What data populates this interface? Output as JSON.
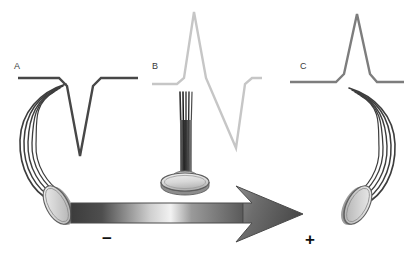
{
  "figure": {
    "background_color": "#ffffff",
    "width": 412,
    "height": 254
  },
  "panels": [
    {
      "id": "A",
      "label": "A",
      "label_x": 14,
      "label_y": 69,
      "trace_color": "#474747",
      "waveform_type": "negative-monophasic",
      "waveform_description": "flat baseline, sharp downward deflection, return to baseline",
      "points": "18,78 59,78 67,86 80,156 93,86 101,78 138,78",
      "electrode": {
        "name": "disc-electrode-left",
        "orientation": "tilted-facing-right",
        "cx": 57,
        "cy": 205,
        "rx": 11,
        "ry": 21,
        "rotation": -28,
        "face_color": "#cfcfcf",
        "rim_color": "#6a6a6a"
      },
      "cable": {
        "name": "cable-bundle-left",
        "strand_count": 5,
        "color": "#3d3d3d",
        "curve": "arcs left and down from trace baseline to electrode"
      }
    },
    {
      "id": "B",
      "label": "B",
      "label_x": 152,
      "label_y": 69,
      "trace_color": "#c6c6c6",
      "waveform_type": "biphasic",
      "waveform_description": "flat baseline, sharp upward deflection then sharp downward deflection, return to baseline",
      "points": "152,84 177,84 184,78 194,12 206,78 236,148 245,84 252,78 262,78",
      "electrode": {
        "name": "disc-electrode-center",
        "orientation": "face-on-horizontal",
        "cx": 185,
        "cy": 182,
        "rx": 24,
        "ry": 9,
        "rotation": 0,
        "face_color": "#d6d6d6",
        "rim_color": "#707070"
      },
      "cable": {
        "name": "cable-bundle-center",
        "strand_count": 5,
        "color": "#2e2e2e",
        "curve": "straight vertical stem from trace down to electrode"
      }
    },
    {
      "id": "C",
      "label": "C",
      "label_x": 300,
      "label_y": 69,
      "trace_color": "#7d7d7d",
      "waveform_type": "positive-monophasic",
      "waveform_description": "flat baseline, sharp upward deflection, return to baseline",
      "points": "290,82 336,82 344,74 357,14 370,74 377,82 404,82",
      "electrode": {
        "name": "disc-electrode-right",
        "orientation": "tilted-facing-left",
        "cx": 358,
        "cy": 205,
        "rx": 11,
        "ry": 21,
        "rotation": 28,
        "face_color": "#cfcfcf",
        "rim_color": "#6a6a6a"
      },
      "cable": {
        "name": "cable-bundle-right",
        "strand_count": 5,
        "color": "#3d3d3d",
        "curve": "arcs right and down from trace baseline to electrode"
      }
    }
  ],
  "arrow": {
    "name": "field-direction-arrow",
    "direction": "left-to-right",
    "description": "broad horizontal gradient arrow pointing right, from negative to positive",
    "gradient_stops": [
      "#3c3c3c",
      "#5a5a5a",
      "#ededed",
      "#8d8d8d",
      "#595959"
    ],
    "stroke_color": "#4a4a4a",
    "shaft_left_x": 71,
    "shaft_right_x": 243,
    "tip_x": 303,
    "center_y": 213
  },
  "polarity": {
    "negative": {
      "symbol": "−",
      "name": "minus-sign",
      "x": 108,
      "y": 243,
      "color": "#111111"
    },
    "positive": {
      "symbol": "+",
      "name": "plus-sign",
      "x": 311,
      "y": 243,
      "color": "#111111"
    }
  }
}
